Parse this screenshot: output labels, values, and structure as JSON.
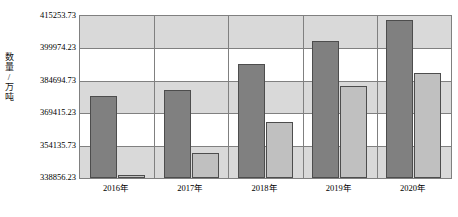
{
  "chart_data": {
    "type": "bar",
    "title": "",
    "xlabel": "",
    "ylabel": "数量/万吨",
    "ylim": [
      338856.23,
      415253.73
    ],
    "grid": true,
    "legend": "none",
    "categories": [
      "2016年",
      "2017年",
      "2018年",
      "2019年",
      "2020年"
    ],
    "ytick_labels": [
      "415253.73",
      "399974.23",
      "384694.73",
      "369415.23",
      "354135.73",
      "338856.23"
    ],
    "ytick_values": [
      415253.73,
      399974.23,
      384694.73,
      369415.23,
      354135.73,
      338856.23
    ],
    "series": [
      {
        "name": "series-1",
        "color": "#808080",
        "values": [
          377500,
          380300,
          392400,
          403600,
          413400
        ]
      },
      {
        "name": "series-2",
        "color": "#c0c0c0",
        "values": [
          340250,
          350500,
          365400,
          382200,
          388200
        ]
      }
    ]
  },
  "axis": {
    "y_title": "数量/万吨"
  },
  "colors": {
    "series1": "#808080",
    "series2": "#c0c0c0",
    "band": "#d9d9d9",
    "grid": "#808080",
    "bar_border": "#4d4d4d"
  }
}
